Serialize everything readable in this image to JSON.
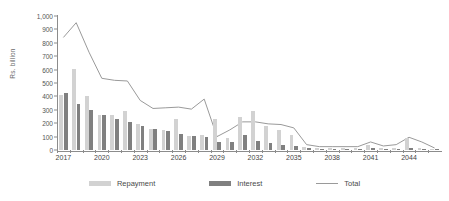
{
  "chart_data": {
    "type": "bar",
    "title": "",
    "subtitle": "",
    "xlabel": "",
    "ylabel": "Rs. billion",
    "ylim": [
      0,
      1000
    ],
    "ytick_step": 100,
    "ytick_labels": [
      "0",
      "100",
      "200",
      "300",
      "400",
      "500",
      "600",
      "700",
      "800",
      "900",
      "1,000"
    ],
    "grid": false,
    "legend_position": "bottom",
    "x_label_interval": 3,
    "categories": [
      "2017",
      "2018",
      "2019",
      "2020",
      "2021",
      "2022",
      "2023",
      "2024",
      "2025",
      "2026",
      "2027",
      "2028",
      "2029",
      "2030",
      "2031",
      "2032",
      "2033",
      "2034",
      "2035",
      "2036",
      "2037",
      "2038",
      "2039",
      "2040",
      "2041",
      "2042",
      "2043",
      "2044",
      "2045",
      "2046"
    ],
    "xtick_labels": [
      "2017",
      "2020",
      "2023",
      "2026",
      "2029",
      "2032",
      "2035",
      "2038",
      "2041",
      "2044"
    ],
    "series": [
      {
        "name": "Repayment",
        "type": "bar",
        "color": "#d2d2d2",
        "values": [
          410,
          605,
          400,
          260,
          260,
          290,
          195,
          155,
          150,
          230,
          105,
          115,
          230,
          90,
          250,
          290,
          180,
          150,
          110,
          20,
          12,
          12,
          12,
          12,
          40,
          12,
          12,
          90,
          12,
          8
        ]
      },
      {
        "name": "Interest",
        "type": "bar",
        "color": "#808080",
        "values": [
          425,
          345,
          300,
          260,
          235,
          210,
          180,
          155,
          145,
          120,
          105,
          100,
          60,
          60,
          115,
          70,
          50,
          40,
          30,
          12,
          10,
          10,
          10,
          10,
          18,
          10,
          10,
          14,
          10,
          6
        ]
      },
      {
        "name": "Total",
        "type": "line",
        "color": "#9a9a9a",
        "values": [
          840,
          950,
          730,
          535,
          520,
          515,
          370,
          310,
          315,
          320,
          305,
          380,
          100,
          150,
          210,
          210,
          195,
          190,
          165,
          40,
          25,
          25,
          25,
          25,
          60,
          30,
          40,
          95,
          60,
          15
        ]
      }
    ]
  },
  "legend": {
    "items": [
      {
        "label": "Repayment",
        "swatch": "rep"
      },
      {
        "label": "Interest",
        "swatch": "int"
      },
      {
        "label": "Total",
        "swatch": "line"
      }
    ]
  },
  "colors": {
    "repayment": "#d2d2d2",
    "interest": "#808080",
    "total_line": "#9a9a9a",
    "axis": "#8c8c8c",
    "text": "#4a4a4a",
    "background": "#ffffff"
  }
}
